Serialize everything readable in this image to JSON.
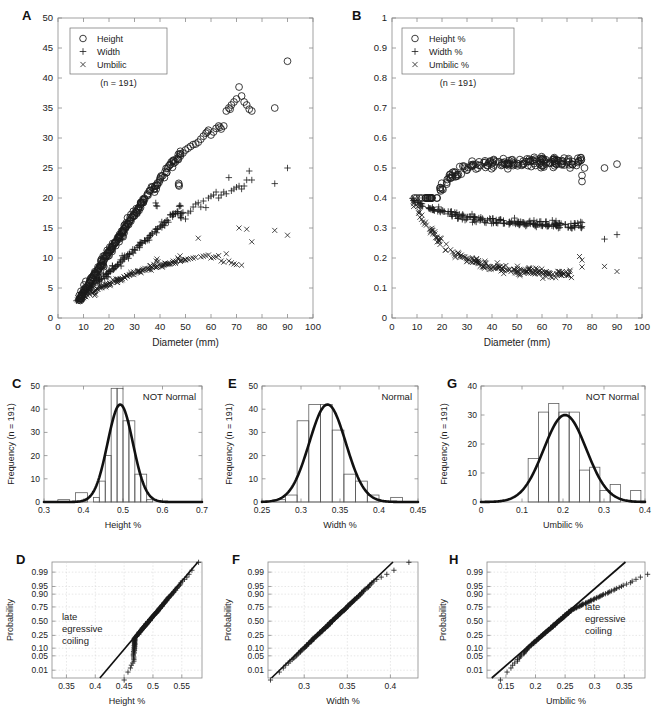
{
  "figure": {
    "panels": [
      "A",
      "B",
      "C",
      "D",
      "E",
      "F",
      "G",
      "H"
    ],
    "sample_note": "(n = 191)"
  },
  "panelA": {
    "label": "A",
    "xlabel": "Diameter (mm)",
    "ylabel": "",
    "legend": [
      "Height",
      "Width",
      "Umbilic"
    ],
    "legend_note": "(n = 191)",
    "xticks": [
      "0",
      "10",
      "20",
      "30",
      "40",
      "50",
      "60",
      "70",
      "80",
      "90",
      "100"
    ],
    "yticks": [
      "0",
      "5",
      "10",
      "15",
      "20",
      "25",
      "30",
      "35",
      "40",
      "45",
      "50"
    ]
  },
  "panelB": {
    "label": "B",
    "xlabel": "Diameter (mm)",
    "ylabel": "",
    "legend": [
      "Height %",
      "Width %",
      "Umbilic %"
    ],
    "legend_note": "(n = 191)",
    "xticks": [
      "0",
      "10",
      "20",
      "30",
      "40",
      "50",
      "60",
      "70",
      "80",
      "90",
      "100"
    ],
    "yticks": [
      "0",
      "0.1",
      "0.2",
      "0.3",
      "0.4",
      "0.5",
      "0.6",
      "0.7",
      "0.8",
      "0.9",
      "1"
    ]
  },
  "panelC": {
    "label": "C",
    "xlabel": "Height %",
    "ylabel": "Frequency (n = 191)",
    "annotation": "NOT Normal",
    "xticks": [
      "0.3",
      "0.4",
      "0.5",
      "0.6",
      "0.7"
    ],
    "yticks": [
      "0",
      "10",
      "20",
      "30",
      "40",
      "50"
    ]
  },
  "panelD": {
    "label": "D",
    "xlabel": "Height %",
    "ylabel": "Probability",
    "annotation": [
      "late",
      "egressive",
      "coiling"
    ],
    "xticks": [
      "0.35",
      "0.4",
      "0.45",
      "0.5",
      "0.55"
    ],
    "yticks": [
      "0.01",
      "0.05",
      "0.10",
      "0.25",
      "0.50",
      "0.75",
      "0.90",
      "0.95",
      "0.99"
    ]
  },
  "panelE": {
    "label": "E",
    "xlabel": "Width %",
    "ylabel": "Frequency (n = 191)",
    "annotation": "Normal",
    "xticks": [
      "0.25",
      "0.3",
      "0.35",
      "0.4",
      "0.45"
    ],
    "yticks": [
      "0",
      "10",
      "20",
      "30",
      "40",
      "50"
    ]
  },
  "panelF": {
    "label": "F",
    "xlabel": "Width %",
    "ylabel": "Probability",
    "annotation": [],
    "xticks": [
      "0.3",
      "0.35",
      "0.4"
    ],
    "yticks": [
      "0.01",
      "0.05",
      "0.10",
      "0.25",
      "0.50",
      "0.75",
      "0.90",
      "0.95",
      "0.99"
    ]
  },
  "panelG": {
    "label": "G",
    "xlabel": "Umbilic %",
    "ylabel": "Frequency (n = 191)",
    "annotation": "NOT Normal",
    "xticks": [
      "0",
      "0.1",
      "0.2",
      "0.3",
      "0.4"
    ],
    "yticks": [
      "0",
      "10",
      "20",
      "30",
      "40"
    ]
  },
  "panelH": {
    "label": "H",
    "xlabel": "Umbilic %",
    "ylabel": "Probability",
    "annotation": [
      "late",
      "egressive",
      "coiling"
    ],
    "xticks": [
      "0.15",
      "0.2",
      "0.25",
      "0.3",
      "0.35"
    ],
    "yticks": [
      "0.01",
      "0.05",
      "0.10",
      "0.25",
      "0.50",
      "0.75",
      "0.90",
      "0.95",
      "0.99"
    ]
  },
  "chart_data": [
    {
      "type": "scatter",
      "panel": "A",
      "title": "",
      "xlabel": "Diameter (mm)",
      "ylabel": "",
      "xlim": [
        0,
        100
      ],
      "ylim": [
        0,
        50
      ],
      "grid": false,
      "legend_position": "top-left",
      "series": [
        {
          "name": "Height",
          "marker": "circle",
          "x": [
            8.2,
            8.6,
            9,
            9.4,
            9.8,
            10.2,
            10.6,
            11,
            11.5,
            12,
            12.4,
            12.8,
            13.2,
            13.6,
            14,
            14.4,
            14.8,
            15.2,
            15.6,
            16,
            16.4,
            16.8,
            17.2,
            17.6,
            18,
            18.4,
            18.8,
            19.2,
            19.6,
            20,
            20.4,
            20.8,
            21.2,
            21.6,
            22,
            22.4,
            22.8,
            23.2,
            23.6,
            24,
            24.4,
            24.8,
            25.2,
            25.6,
            26,
            26.5,
            27,
            27.5,
            28,
            28.5,
            29,
            29.5,
            30,
            30.5,
            31,
            31.5,
            32,
            32.5,
            33,
            33.5,
            34,
            35,
            36,
            37,
            38,
            38.5,
            39,
            40,
            41,
            42,
            43,
            44,
            45,
            46,
            47,
            47.5,
            48,
            49,
            50,
            51,
            52,
            53,
            54,
            55,
            56,
            57,
            58,
            58.5,
            59,
            60,
            61,
            62,
            63,
            63.5,
            64,
            65,
            66,
            67,
            67.5,
            68,
            69,
            70,
            71,
            72,
            73,
            74,
            75,
            76,
            85,
            90
          ],
          "y": [
            3.0,
            3.3,
            3.6,
            3.9,
            4.2,
            4.4,
            4.7,
            5.0,
            5.3,
            5.6,
            5.9,
            6.2,
            6.4,
            6.7,
            7.0,
            7.2,
            7.5,
            7.8,
            8.0,
            8.3,
            8.6,
            8.8,
            9.1,
            9.4,
            9.6,
            9.9,
            10.2,
            10.4,
            10.7,
            11.0,
            11.2,
            11.5,
            11.7,
            12.0,
            12.3,
            12.5,
            12.8,
            13.0,
            13.3,
            13.6,
            13.8,
            14.1,
            14.3,
            14.6,
            14.9,
            15.2,
            15.5,
            15.8,
            16.1,
            16.5,
            16.8,
            17.1,
            17.4,
            17.7,
            18.0,
            18.3,
            18.6,
            18.9,
            19.2,
            19.5,
            19.8,
            20.5,
            21.2,
            21.8,
            22.0,
            21.5,
            22.5,
            23.0,
            23.7,
            24.4,
            25.0,
            25.6,
            26.2,
            26.0,
            26.5,
            22.0,
            27.0,
            27.5,
            28.0,
            28.3,
            28.6,
            28.9,
            29.0,
            29.3,
            29.8,
            30.3,
            30.8,
            31.0,
            31.3,
            30.5,
            31.0,
            31.6,
            32.0,
            31.8,
            31.5,
            32.0,
            34.5,
            35.0,
            34.8,
            35.5,
            36.0,
            36.5,
            38.5,
            37.0,
            36.0,
            35.5,
            34.8,
            34.5,
            35.0,
            42.8,
            46.2
          ]
        },
        {
          "name": "Width",
          "marker": "plus",
          "x": [
            8.2,
            9,
            9.8,
            10.6,
            11.5,
            12.4,
            13.2,
            14,
            14.8,
            15.6,
            16.4,
            17.2,
            18,
            18.8,
            19.6,
            20.4,
            21.2,
            22,
            22.8,
            23.6,
            24.4,
            25.2,
            26,
            27,
            28,
            29,
            30,
            31,
            32,
            33,
            34,
            35,
            36,
            37,
            38,
            38.5,
            39,
            40,
            41,
            42,
            43,
            44,
            45,
            46,
            47,
            47.5,
            48,
            49,
            50,
            51,
            52,
            53,
            54,
            55,
            56,
            57,
            58,
            59,
            60,
            61,
            62,
            63,
            64,
            65,
            66,
            67,
            68,
            69,
            70,
            71,
            72,
            73,
            74,
            75,
            76,
            85,
            90
          ],
          "y": [
            3.0,
            3.4,
            3.8,
            4.2,
            4.6,
            4.9,
            5.2,
            5.5,
            5.8,
            6.1,
            6.4,
            6.6,
            6.9,
            7.2,
            7.5,
            7.8,
            8.0,
            8.3,
            8.6,
            8.9,
            9.2,
            9.5,
            9.8,
            10.2,
            10.6,
            11.0,
            11.4,
            11.8,
            12.2,
            12.5,
            12.9,
            13.3,
            13.7,
            14.0,
            14.4,
            18.7,
            14.8,
            15.2,
            15.5,
            15.9,
            16.3,
            17.2,
            17.3,
            17.4,
            17.5,
            18.6,
            17.0,
            17.6,
            16.5,
            17.5,
            17.8,
            18.5,
            19.0,
            19.2,
            18.5,
            19.5,
            18.4,
            20.0,
            20.3,
            20.5,
            21.0,
            20.0,
            20.5,
            21.0,
            20.7,
            23.4,
            21.2,
            21.5,
            21.8,
            22.0,
            21.5,
            22.0,
            23.0,
            24.5,
            23.0,
            22.4,
            25.0
          ]
        },
        {
          "name": "Umbilic",
          "marker": "ex",
          "x": [
            8.2,
            9,
            9.8,
            10.6,
            11.5,
            12.4,
            13.2,
            14,
            14.8,
            15.6,
            16.4,
            17.2,
            18,
            18.8,
            19.6,
            20.4,
            21.2,
            22,
            22.8,
            23.6,
            24.4,
            25.2,
            26,
            27,
            28,
            29,
            30,
            31,
            32,
            33,
            34,
            35,
            36,
            37,
            38,
            38.5,
            39,
            40,
            41,
            42,
            43,
            44,
            45,
            46,
            47,
            48,
            49,
            50,
            51,
            52,
            53,
            54,
            55,
            56,
            57,
            58,
            59,
            60,
            61,
            62,
            63,
            64,
            65,
            66,
            67,
            68,
            69,
            70,
            71,
            72,
            74,
            76,
            85,
            90
          ],
          "y": [
            3.0,
            3.2,
            3.4,
            3.6,
            3.8,
            4.0,
            4.2,
            4.4,
            4.6,
            4.8,
            5.0,
            5.1,
            5.3,
            5.5,
            5.6,
            5.8,
            5.9,
            6.1,
            6.2,
            6.4,
            6.5,
            6.6,
            6.8,
            7.0,
            7.2,
            7.3,
            7.5,
            7.6,
            7.8,
            7.9,
            8.0,
            8.2,
            8.3,
            8.4,
            8.5,
            9.5,
            8.6,
            8.7,
            8.8,
            8.9,
            9.0,
            9.1,
            9.2,
            9.3,
            10.0,
            9.5,
            9.6,
            9.7,
            9.8,
            9.9,
            10.0,
            10.1,
            13.3,
            10.2,
            10.3,
            10.4,
            10.5,
            10.0,
            10.1,
            10.2,
            10.4,
            9.5,
            9.3,
            10.7,
            9.5,
            9.2,
            9.0,
            8.9,
            15.0,
            8.8,
            14.8,
            12.7,
            14.6,
            13.8
          ]
        }
      ]
    },
    {
      "type": "scatter",
      "panel": "B",
      "title": "",
      "xlabel": "Diameter (mm)",
      "ylabel": "",
      "xlim": [
        0,
        100
      ],
      "ylim": [
        0,
        1
      ],
      "grid": false,
      "legend_position": "top-left",
      "series": [
        {
          "name": "Height %",
          "marker": "circle",
          "approx_range": [
            0.42,
            0.59
          ],
          "trend": "rises from ~0.40 at 10mm to plateau ~0.50-0.53"
        },
        {
          "name": "Width %",
          "marker": "plus",
          "approx_range": [
            0.27,
            0.4
          ],
          "trend": "declines slowly from ~0.38 to ~0.31"
        },
        {
          "name": "Umbilic %",
          "marker": "ex",
          "approx_range": [
            0.12,
            0.39
          ],
          "trend": "declines from ~0.38 at 8mm to ~0.13-0.17"
        }
      ]
    },
    {
      "type": "bar",
      "panel": "C",
      "title": "",
      "xlabel": "Height %",
      "ylabel": "Frequency (n = 191)",
      "annotation": "NOT Normal",
      "xlim": [
        0.3,
        0.7
      ],
      "ylim": [
        0,
        50
      ],
      "bin_edges": [
        0.335,
        0.365,
        0.38,
        0.41,
        0.425,
        0.44,
        0.455,
        0.47,
        0.485,
        0.5,
        0.515,
        0.53,
        0.545,
        0.56,
        0.575
      ],
      "categories": [
        "0.335-0.365",
        "0.365-0.380",
        "0.380-0.410",
        "0.410-0.425",
        "0.425-0.440",
        "0.440-0.455",
        "0.455-0.470",
        "0.470-0.485",
        "0.485-0.500",
        "0.500-0.515",
        "0.515-0.530",
        "0.530-0.545",
        "0.545-0.560",
        "0.560-0.575"
      ],
      "values": [
        1,
        0,
        4,
        0,
        2,
        9,
        20,
        49,
        49,
        35,
        35,
        12,
        12,
        1
      ],
      "normal_curve": {
        "mu": 0.493,
        "sigma": 0.032,
        "peak": 42
      }
    },
    {
      "type": "bar",
      "panel": "E",
      "title": "",
      "xlabel": "Width %",
      "ylabel": "Frequency (n = 191)",
      "annotation": "Normal",
      "xlim": [
        0.25,
        0.45
      ],
      "ylim": [
        0,
        50
      ],
      "bin_edges": [
        0.265,
        0.28,
        0.295,
        0.31,
        0.325,
        0.34,
        0.355,
        0.37,
        0.385,
        0.4,
        0.415,
        0.43
      ],
      "categories": [
        "0.265-0.280",
        "0.280-0.295",
        "0.295-0.310",
        "0.310-0.325",
        "0.325-0.340",
        "0.340-0.355",
        "0.355-0.370",
        "0.370-0.385",
        "0.385-0.400",
        "0.400-0.415",
        "0.415-0.430"
      ],
      "values": [
        1,
        3,
        35,
        42,
        42,
        31,
        12,
        9,
        3,
        0,
        2
      ],
      "normal_curve": {
        "mu": 0.334,
        "sigma": 0.0235,
        "peak": 42
      }
    },
    {
      "type": "bar",
      "panel": "G",
      "title": "",
      "xlabel": "Umbilic %",
      "ylabel": "Frequency (n = 191)",
      "annotation": "NOT Normal",
      "xlim": [
        0,
        0.4
      ],
      "ylim": [
        0,
        40
      ],
      "bin_edges": [
        0.115,
        0.14,
        0.165,
        0.19,
        0.215,
        0.24,
        0.265,
        0.29,
        0.315,
        0.34,
        0.365,
        0.39
      ],
      "categories": [
        "0.115-0.140",
        "0.140-0.165",
        "0.165-0.190",
        "0.190-0.215",
        "0.215-0.240",
        "0.240-0.265",
        "0.265-0.290",
        "0.290-0.315",
        "0.315-0.340",
        "0.340-0.365",
        "0.365-0.390"
      ],
      "values": [
        15,
        31,
        34,
        31,
        31,
        11,
        12,
        4,
        6,
        0,
        4
      ],
      "normal_curve": {
        "mu": 0.205,
        "sigma": 0.052,
        "peak": 30
      }
    },
    {
      "type": "scatter",
      "panel": "D",
      "subtype": "normal-probability-plot",
      "xlabel": "Height %",
      "ylabel": "Probability",
      "xlim": [
        0.325,
        0.585
      ],
      "prob_ticks": [
        0.01,
        0.05,
        0.1,
        0.25,
        0.5,
        0.75,
        0.9,
        0.95,
        0.99
      ],
      "annotation": "late egressive coiling",
      "reference_line": {
        "x0": 0.408,
        "x1": 0.578
      },
      "note": "data deviates left of reference line at low probabilities"
    },
    {
      "type": "scatter",
      "panel": "F",
      "subtype": "normal-probability-plot",
      "xlabel": "Width %",
      "ylabel": "Probability",
      "xlim": [
        0.258,
        0.432
      ],
      "prob_ticks": [
        0.01,
        0.05,
        0.1,
        0.25,
        0.5,
        0.75,
        0.9,
        0.95,
        0.99
      ],
      "annotation": "",
      "reference_line": {
        "x0": 0.262,
        "x1": 0.403
      },
      "note": "data follows reference line closely (normal)"
    },
    {
      "type": "scatter",
      "panel": "H",
      "subtype": "normal-probability-plot",
      "xlabel": "Umbilic %",
      "ylabel": "Probability",
      "xlim": [
        0.118,
        0.385
      ],
      "prob_ticks": [
        0.01,
        0.05,
        0.1,
        0.25,
        0.5,
        0.75,
        0.9,
        0.95,
        0.99
      ],
      "annotation": "late egressive coiling",
      "reference_line": {
        "x0": 0.126,
        "x1": 0.352
      },
      "note": "data falls right of reference line at high probabilities"
    }
  ]
}
